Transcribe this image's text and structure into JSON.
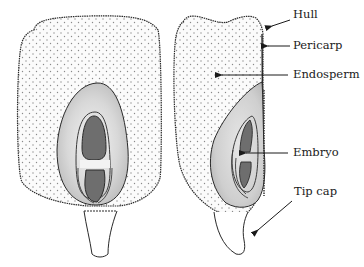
{
  "diagram": {
    "views": [
      "longitudinal section (face view)",
      "longitudinal section (side view)"
    ],
    "labels": [
      {
        "id": "hull",
        "text": "Hull",
        "x": 293,
        "y": 15
      },
      {
        "id": "pericarp",
        "text": "Pericarp",
        "x": 293,
        "y": 40
      },
      {
        "id": "endosperm",
        "text": "Endosperm",
        "x": 293,
        "y": 69
      },
      {
        "id": "embryo",
        "text": "Embryo",
        "x": 293,
        "y": 148
      },
      {
        "id": "tip-cap",
        "text": "Tip cap",
        "x": 294,
        "y": 186
      }
    ],
    "colors": {
      "outline": "#2a2a2a",
      "endosperm_fill": "#fbfbfb",
      "stipple": "#8a8a8a",
      "embryo_outer": "#c9c9c9",
      "embryo_light": "#ececec",
      "embryo_dark": "#6e6e6e",
      "arrow": "#1a1a1a"
    }
  }
}
